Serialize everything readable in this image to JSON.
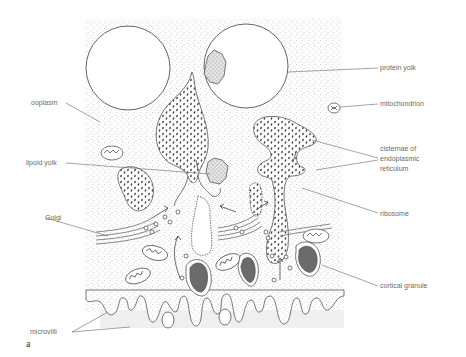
{
  "figure": {
    "letter": "a"
  },
  "labels": {
    "protein_yolk": "protein yolk",
    "mitochondrion": "mitochondrion",
    "ooplasm": "ooplasm",
    "lipoid_yolk": "lipoid yolk",
    "cisternae_line1": "cisternae of",
    "cisternae_line2": "endoplasmic",
    "cisternae_line3": "reticulum",
    "golgi": "Golgi",
    "ribosome": "ribosome",
    "cortical_granule": "cortical granule",
    "microvilli": "microvilli"
  },
  "colors": {
    "line": "#555555",
    "stipple": "#b8b8b8",
    "granule_fill": "#6b6b6b",
    "label_text": "#6a6a6a",
    "basal_band": "#efefef"
  }
}
